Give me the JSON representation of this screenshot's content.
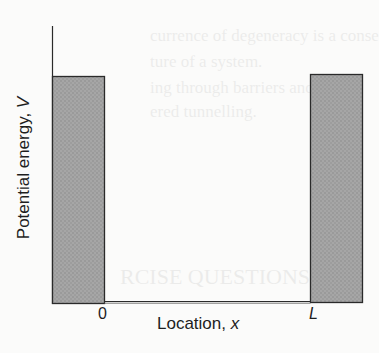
{
  "show_through_text": [
    "currence of degeneracy is a conse",
    "ture of a system.",
    "ing through barriers and is illu",
    "ered tunnelling.",
    "RCISE QUESTIONS"
  ],
  "diagram": {
    "y_axis": {
      "label": "Potential energy, ",
      "variable": "V"
    },
    "x_axis": {
      "label": "Location, ",
      "variable": "x"
    },
    "ticks": [
      {
        "label": "0",
        "italic": false
      },
      {
        "label": "L",
        "italic": true
      }
    ],
    "regions": [
      {
        "name": "left-wall",
        "x_from": "-",
        "x_to": "0",
        "potential": "high"
      },
      {
        "name": "well",
        "x_from": "0",
        "x_to": "L",
        "potential": "0"
      },
      {
        "name": "right-wall",
        "x_from": "L",
        "x_to": "+",
        "potential": "high"
      }
    ],
    "colors": {
      "wall_fill": "#a3a3a3",
      "line": "#2a2a2a",
      "background": "#fbfbfa"
    }
  }
}
